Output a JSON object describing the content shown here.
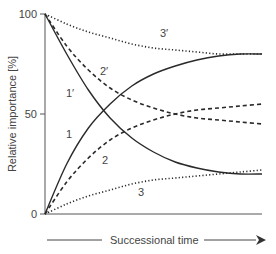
{
  "chart_data": {
    "type": "line",
    "title": "",
    "xlabel": "Successional time",
    "ylabel": "Relative importance [%]",
    "ylim": [
      0,
      100
    ],
    "xlim": [
      0,
      1
    ],
    "yticks": [
      0,
      50,
      100
    ],
    "ytick_labels": [
      "0",
      "50",
      "100"
    ],
    "grid": false,
    "legend": "inline curve labels",
    "x": [
      0,
      0.1,
      0.2,
      0.3,
      0.4,
      0.5,
      0.6,
      0.7,
      0.8,
      0.9,
      1.0
    ],
    "series": [
      {
        "name": "1",
        "style": "solid",
        "values": [
          0,
          25,
          43,
          55,
          64,
          70,
          74,
          77,
          79,
          80,
          80
        ]
      },
      {
        "name": "1'",
        "style": "solid",
        "values": [
          100,
          80,
          62,
          48,
          38,
          31,
          26,
          23,
          21,
          20,
          20
        ]
      },
      {
        "name": "2",
        "style": "dashed",
        "values": [
          0,
          16,
          28,
          37,
          43,
          47,
          50,
          52,
          53,
          54,
          55
        ]
      },
      {
        "name": "2'",
        "style": "dashed",
        "values": [
          100,
          84,
          72,
          63,
          57,
          53,
          50,
          48,
          47,
          46,
          45
        ]
      },
      {
        "name": "3",
        "style": "dotted",
        "values": [
          0,
          5,
          9,
          12,
          15,
          17,
          18,
          19,
          20,
          21,
          22
        ]
      },
      {
        "name": "3'",
        "style": "dotted",
        "values": [
          100,
          95,
          91,
          88,
          85,
          83,
          82,
          81,
          80,
          80,
          80
        ]
      }
    ],
    "annotations": [
      {
        "text": "1",
        "x": 0.08,
        "y": 40
      },
      {
        "text": "1′",
        "x": 0.08,
        "y": 61
      },
      {
        "text": "2",
        "x": 0.3,
        "y": 28
      },
      {
        "text": "2′",
        "x": 0.3,
        "y": 71
      },
      {
        "text": "3",
        "x": 0.5,
        "y": 12
      },
      {
        "text": "3′",
        "x": 0.6,
        "y": 90
      }
    ]
  },
  "labels": {
    "y_axis_title": "Relative importance [%]",
    "x_axis_title": "Successional time",
    "tick_0": "0",
    "tick_50": "50",
    "tick_100": "100",
    "curve_1": "1",
    "curve_1p": "1′",
    "curve_2": "2",
    "curve_2p": "2′",
    "curve_3": "3",
    "curve_3p": "3′"
  }
}
